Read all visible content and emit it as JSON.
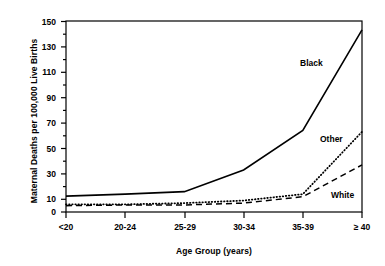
{
  "chart_data": {
    "type": "line",
    "title": "",
    "xlabel": "Age Group (years)",
    "ylabel": "Maternal Deaths per 100,000 Live Births",
    "categories": [
      "<20",
      "20-24",
      "25-29",
      "30-34",
      "35-39",
      "≥ 40"
    ],
    "xtick_labels": [
      "<20",
      "20-24",
      "25-29",
      "30-34",
      "35-39",
      "≥ 40"
    ],
    "ytick_labels": [
      "0",
      "10",
      "30",
      "50",
      "70",
      "90",
      "110",
      "130",
      "150"
    ],
    "ytick_values": [
      0,
      10,
      30,
      50,
      70,
      90,
      110,
      130,
      150
    ],
    "yminor_values": [
      20,
      40,
      60,
      80,
      100,
      120,
      140
    ],
    "ylim": [
      0,
      150
    ],
    "grid": false,
    "legend": "inline-annotations",
    "series": [
      {
        "name": "Black",
        "label": "Black",
        "style": "solid",
        "color": "#000000",
        "values": [
          12.5,
          14,
          16,
          33,
          64,
          143
        ],
        "label_x": 300,
        "label_y": 58
      },
      {
        "name": "Other",
        "label": "Other",
        "style": "dotted",
        "color": "#000000",
        "values": [
          6,
          6,
          7,
          9,
          14,
          63
        ],
        "label_x": 320,
        "label_y": 134
      },
      {
        "name": "White",
        "label": "White",
        "style": "dashed",
        "color": "#000000",
        "values": [
          5,
          5.5,
          5.5,
          7,
          12,
          37
        ],
        "label_x": 331,
        "label_y": 190
      }
    ]
  }
}
